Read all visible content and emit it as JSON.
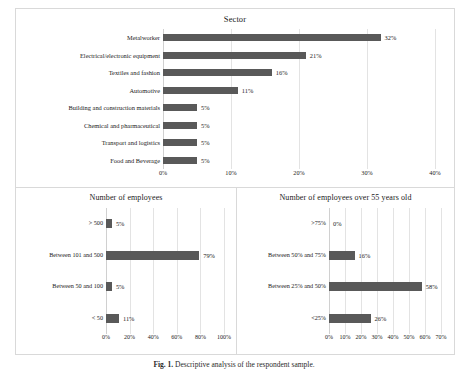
{
  "figure": {
    "caption_label": "Fig. 1.",
    "caption_text": "Descriptive analysis of the respondent sample."
  },
  "chart_data": [
    {
      "type": "bar",
      "orientation": "horizontal",
      "title": "Sector",
      "xlabel": "",
      "ylabel": "",
      "categories": [
        "Metalworker",
        "Electrical/electronic equipment",
        "Textiles and fashion",
        "Automotive",
        "Building and construction materials",
        "Chemical and pharmaceutical",
        "Transport and logistics",
        "Food and Beverage"
      ],
      "values": [
        32,
        21,
        16,
        11,
        5,
        5,
        5,
        5
      ],
      "value_labels": [
        "32%",
        "21%",
        "16%",
        "11%",
        "5%",
        "5%",
        "5%",
        "5%"
      ],
      "xticks": [
        0,
        10,
        20,
        30,
        40
      ],
      "xtick_labels": [
        "0%",
        "10%",
        "20%",
        "30%",
        "40%"
      ],
      "xlim": [
        0,
        40
      ],
      "grid": true,
      "legend": "none",
      "bar_color": "#595959"
    },
    {
      "type": "bar",
      "orientation": "horizontal",
      "title": "Number of employees",
      "xlabel": "",
      "ylabel": "",
      "categories": [
        "> 500",
        "Between 101 and 500",
        "Between 50 and 100",
        "< 50"
      ],
      "values": [
        5,
        79,
        5,
        11
      ],
      "value_labels": [
        "5%",
        "79%",
        "5%",
        "11%"
      ],
      "xticks": [
        0,
        20,
        40,
        60,
        80,
        100
      ],
      "xtick_labels": [
        "0%",
        "20%",
        "40%",
        "60%",
        "80%",
        "100%"
      ],
      "xlim": [
        0,
        100
      ],
      "grid": true,
      "legend": "none",
      "bar_color": "#595959"
    },
    {
      "type": "bar",
      "orientation": "horizontal",
      "title": "Number of employees over 55 years old",
      "xlabel": "",
      "ylabel": "",
      "categories": [
        ">75%",
        "Between 50% and 75%",
        "Between 25% and 50%",
        "<25%"
      ],
      "values": [
        0,
        16,
        58,
        26
      ],
      "value_labels": [
        "0%",
        "16%",
        "58%",
        "26%"
      ],
      "xticks": [
        0,
        10,
        20,
        30,
        40,
        50,
        60,
        70
      ],
      "xtick_labels": [
        "0%",
        "10%",
        "20%",
        "30%",
        "40%",
        "50%",
        "60%",
        "70%"
      ],
      "xlim": [
        0,
        70
      ],
      "grid": true,
      "legend": "none",
      "bar_color": "#595959"
    }
  ]
}
